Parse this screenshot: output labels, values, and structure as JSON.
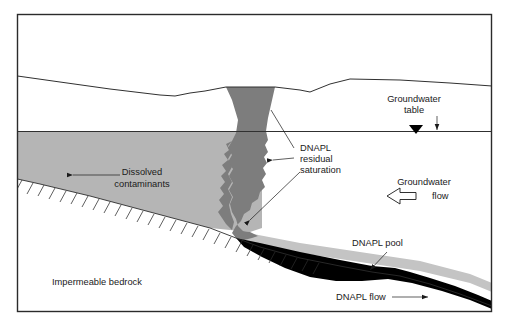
{
  "figure": {
    "type": "hydrogeology-cross-section",
    "background_color": "#ffffff",
    "frame_color": "#2b2b2b"
  },
  "colors": {
    "dissolved_plume": "#b5b5b5",
    "dnapl_residual": "#7d7d7d",
    "dnapl_pool": "#000000",
    "pool_halo": "#c4c4c4",
    "line": "#2b2b2b",
    "text": "#1a1a1a"
  },
  "labels": {
    "groundwater_table": {
      "line1": "Groundwater",
      "line2": "table"
    },
    "dnapl_residual": {
      "line1": "DNAPL",
      "line2": "residual",
      "line3": "saturation"
    },
    "groundwater_flow": {
      "line1": "Groundwater",
      "line2": "flow"
    },
    "dissolved_contaminants": {
      "line1": "Dissolved",
      "line2": "contaminants"
    },
    "dnapl_pool": "DNAPL pool",
    "dnapl_flow": "DNAPL flow",
    "impermeable_bedrock": "Impermeable bedrock"
  },
  "features": [
    {
      "name": "ground-surface",
      "description": "land surface profile line"
    },
    {
      "name": "water-table",
      "description": "horizontal groundwater table line"
    },
    {
      "name": "water-table-marker",
      "description": "filled downward triangle on water table"
    },
    {
      "name": "dissolved-plume",
      "description": "light gray dissolved contaminant plume below water table"
    },
    {
      "name": "dnapl-residual-column",
      "description": "dark gray vertical DNAPL residual saturation finger"
    },
    {
      "name": "dnapl-pool",
      "description": "black DNAPL pool resting on bedrock"
    },
    {
      "name": "bedrock-surface",
      "description": "sloping impermeable bedrock contact with hatch ticks"
    }
  ],
  "arrows": [
    {
      "name": "groundwater-flow-arrow",
      "direction": "left",
      "style": "hollow-block"
    },
    {
      "name": "dissolved-contaminants-arrow",
      "direction": "left",
      "style": "thin-line"
    },
    {
      "name": "dnapl-flow-arrow",
      "direction": "right",
      "style": "thin-line"
    },
    {
      "name": "groundwater-table-arrow",
      "direction": "down",
      "style": "thin-line"
    }
  ]
}
